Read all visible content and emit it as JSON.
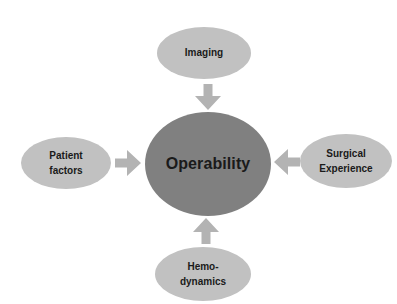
{
  "diagram": {
    "type": "hub-and-spoke",
    "background_color": "#ffffff",
    "hub": {
      "label": "Operability",
      "color": "#808080",
      "text_color": "#1a1a1a"
    },
    "satellite_color": "#c1c1c1",
    "arrow_color": "#b3b3b3",
    "nodes": [
      {
        "id": "imaging",
        "position": "top",
        "lines": [
          "Imaging"
        ],
        "arrow": "arrow-down-icon"
      },
      {
        "id": "patient-factors",
        "position": "left",
        "lines": [
          "Patient",
          "factors"
        ],
        "arrow": "arrow-right-icon"
      },
      {
        "id": "surgical-experience",
        "position": "right",
        "lines": [
          "Surgical",
          "Experience"
        ],
        "arrow": "arrow-left-icon"
      },
      {
        "id": "hemodynamics",
        "position": "bottom",
        "lines": [
          "Hemo-",
          "dynamics"
        ],
        "arrow": "arrow-up-icon"
      }
    ]
  }
}
